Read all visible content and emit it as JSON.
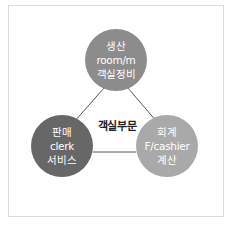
{
  "diagram": {
    "center_label": "객실부문",
    "nodes": [
      {
        "id": "top",
        "lines": [
          "생산",
          "room/m",
          "객실정비"
        ],
        "color": "#8c8c8c"
      },
      {
        "id": "left",
        "lines": [
          "판매",
          "clerk",
          "서비스"
        ],
        "color": "#676767"
      },
      {
        "id": "right",
        "lines": [
          "회계",
          "F/cashier",
          "계산"
        ],
        "color": "#a9a9a9"
      }
    ],
    "edges": [
      [
        "top",
        "left"
      ],
      [
        "top",
        "right"
      ],
      [
        "left",
        "right"
      ]
    ],
    "line_color": "#555555",
    "frame_border_color": "#dcdcdc"
  }
}
